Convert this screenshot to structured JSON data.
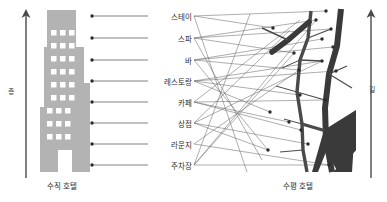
{
  "figure": {
    "title_vertical": "수직 호텔",
    "title_horizontal": "수평 호텔",
    "axis_left": "층",
    "axis_right": "길",
    "background_color": "#ffffff",
    "building_color": "#b3b3b3",
    "window_color": "#ffffff",
    "street_color": "#3a3a3a",
    "leader_line_color": "#4a4a4a",
    "node_color": "#2b2b2b"
  },
  "programs": [
    {
      "label": "스테이",
      "y": 16,
      "node_x": 92,
      "node_y": 16
    },
    {
      "label": "스파",
      "y": 38,
      "node_x": 92,
      "node_y": 38
    },
    {
      "label": "바",
      "y": 60,
      "node_x": 92,
      "node_y": 60
    },
    {
      "label": "레스토랑",
      "y": 81,
      "node_x": 92,
      "node_y": 81
    },
    {
      "label": "카페",
      "y": 102,
      "node_x": 92,
      "node_y": 102
    },
    {
      "label": "상점",
      "y": 123,
      "node_x": 92,
      "node_y": 123
    },
    {
      "label": "라운지",
      "y": 144,
      "node_x": 92,
      "node_y": 144
    },
    {
      "label": "주차장",
      "y": 165,
      "node_x": 92,
      "node_y": 165
    }
  ],
  "horizontal_nodes": [
    {
      "x": 273,
      "y": 28
    },
    {
      "x": 294,
      "y": 53
    },
    {
      "x": 299,
      "y": 70
    },
    {
      "x": 300,
      "y": 95
    },
    {
      "x": 301,
      "y": 130
    },
    {
      "x": 308,
      "y": 144
    },
    {
      "x": 316,
      "y": 20
    },
    {
      "x": 322,
      "y": 39
    },
    {
      "x": 322,
      "y": 61
    },
    {
      "x": 325,
      "y": 100
    },
    {
      "x": 326,
      "y": 11
    },
    {
      "x": 329,
      "y": 165
    },
    {
      "x": 331,
      "y": 29
    },
    {
      "x": 333,
      "y": 47
    },
    {
      "x": 336,
      "y": 71
    },
    {
      "x": 270,
      "y": 112
    },
    {
      "x": 268,
      "y": 150
    },
    {
      "x": 289,
      "y": 122
    }
  ],
  "chart_data": {
    "type": "diagram",
    "categories": [
      "스테이",
      "스파",
      "바",
      "레스토랑",
      "카페",
      "상점",
      "라운지",
      "주차장"
    ],
    "left_axis": "층",
    "right_axis": "길",
    "panels": [
      {
        "name": "수직 호텔",
        "axis": "층",
        "arrangement": "stacked vertically by floor"
      },
      {
        "name": "수평 호텔",
        "axis": "길",
        "arrangement": "dispersed horizontally along streets"
      }
    ]
  }
}
